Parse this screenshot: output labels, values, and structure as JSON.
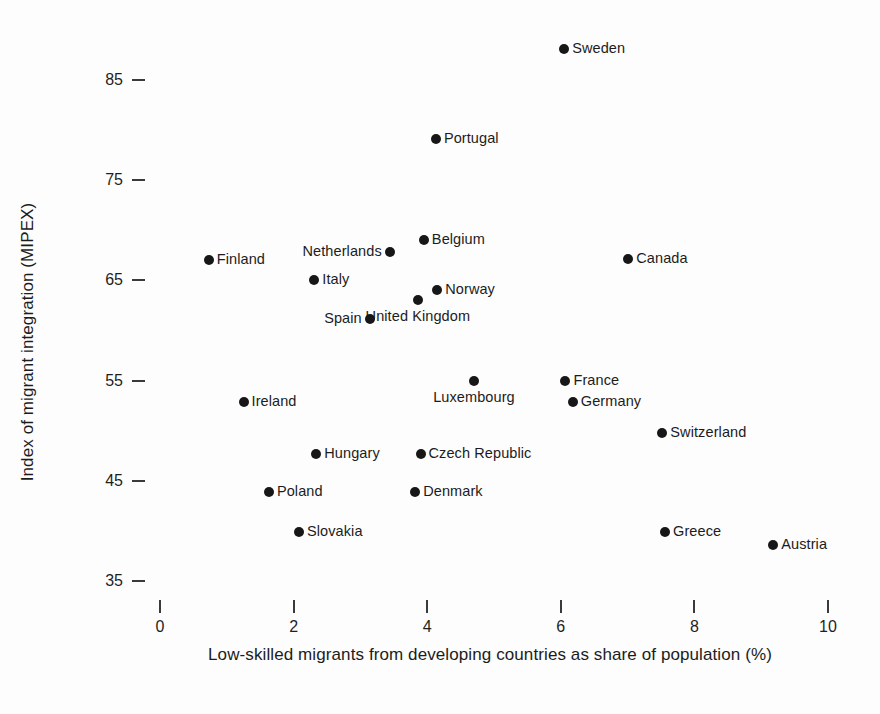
{
  "chart_data": {
    "type": "scatter",
    "title": "",
    "xlabel": "Low-skilled migrants from developing countries as share of population (%)",
    "ylabel": "Index of migrant integration (MIPEX)",
    "xlim": [
      -0.6,
      10.4
    ],
    "ylim": [
      33.0,
      90.0
    ],
    "xticks": [
      "0",
      "2",
      "4",
      "6",
      "8",
      "10"
    ],
    "xtick_values": [
      0,
      2,
      4,
      6,
      8,
      10
    ],
    "yticks": [
      "85",
      "75",
      "65",
      "55",
      "45",
      "35"
    ],
    "ytick_values": [
      85,
      75,
      65,
      55,
      45,
      35
    ],
    "grid": false,
    "legend": "none",
    "marker_color": "#171717",
    "points": [
      {
        "label": "Sweden",
        "x": 6.05,
        "y": 88.1,
        "label_pos": "right"
      },
      {
        "label": "Portugal",
        "x": 4.13,
        "y": 79.1,
        "label_pos": "right"
      },
      {
        "label": "Belgium",
        "x": 3.95,
        "y": 69.0,
        "label_pos": "right"
      },
      {
        "label": "Netherlands",
        "x": 3.44,
        "y": 67.8,
        "label_pos": "left"
      },
      {
        "label": "Finland",
        "x": 0.73,
        "y": 67.0,
        "label_pos": "right"
      },
      {
        "label": "Canada",
        "x": 7.01,
        "y": 67.1,
        "label_pos": "right"
      },
      {
        "label": "Italy",
        "x": 2.31,
        "y": 65.0,
        "label_pos": "right"
      },
      {
        "label": "Norway",
        "x": 4.15,
        "y": 64.0,
        "label_pos": "right"
      },
      {
        "label": "United Kingdom",
        "x": 3.86,
        "y": 63.0,
        "label_pos": "below"
      },
      {
        "label": "Spain",
        "x": 3.14,
        "y": 61.1,
        "label_pos": "left"
      },
      {
        "label": "Luxembourg",
        "x": 4.7,
        "y": 55.0,
        "label_pos": "below"
      },
      {
        "label": "France",
        "x": 6.07,
        "y": 55.0,
        "label_pos": "right"
      },
      {
        "label": "Germany",
        "x": 6.18,
        "y": 52.9,
        "label_pos": "right"
      },
      {
        "label": "Ireland",
        "x": 1.25,
        "y": 52.9,
        "label_pos": "right"
      },
      {
        "label": "Switzerland",
        "x": 7.52,
        "y": 49.8,
        "label_pos": "right"
      },
      {
        "label": "Hungary",
        "x": 2.34,
        "y": 47.7,
        "label_pos": "right"
      },
      {
        "label": "Czech Republic",
        "x": 3.9,
        "y": 47.7,
        "label_pos": "right"
      },
      {
        "label": "Poland",
        "x": 1.63,
        "y": 43.9,
        "label_pos": "right"
      },
      {
        "label": "Denmark",
        "x": 3.82,
        "y": 43.9,
        "label_pos": "right"
      },
      {
        "label": "Slovakia",
        "x": 2.08,
        "y": 39.9,
        "label_pos": "right"
      },
      {
        "label": "Greece",
        "x": 7.56,
        "y": 39.9,
        "label_pos": "right"
      },
      {
        "label": "Austria",
        "x": 9.18,
        "y": 38.6,
        "label_pos": "right"
      }
    ]
  }
}
